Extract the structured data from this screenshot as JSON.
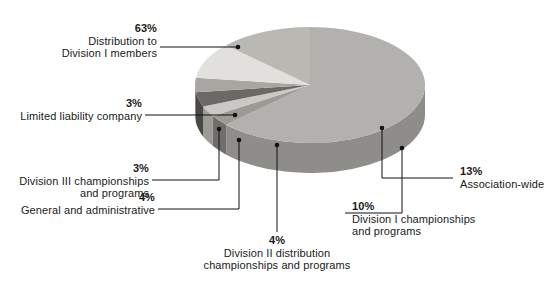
{
  "chart_data": {
    "type": "pie",
    "title": "",
    "subtitle": "",
    "xlabel": "",
    "ylabel": "",
    "legend_position": "callout-labels",
    "grid": false,
    "style": "3d-pie",
    "categories": [
      "Distribution to Division I members",
      "Limited liability company",
      "Division III championships and programs",
      "General and administrative",
      "Division II distribution championships and programs",
      "Division I championships and programs",
      "Association-wide"
    ],
    "values": [
      63,
      3,
      3,
      4,
      4,
      10,
      13
    ],
    "unit": "%",
    "slices": [
      {
        "label": "Distribution to Division I members",
        "value": 63,
        "value_text": "63%",
        "color": "#b2b1ad",
        "side_color": "#8e8d89"
      },
      {
        "label": "Limited liability company",
        "value": 3,
        "value_text": "3%",
        "color": "#9b9a95",
        "side_color": "#6f6e6a"
      },
      {
        "label": "Division III championships and programs",
        "value": 3,
        "value_text": "3%",
        "color": "#c9c8c4",
        "side_color": "#9c9b96"
      },
      {
        "label": "General and administrative",
        "value": 4,
        "value_text": "4%",
        "color": "#6b6965",
        "side_color": "#4a4845"
      },
      {
        "label": "Division II distribution championships and programs",
        "value": 4,
        "value_text": "4%",
        "color": "#a7a6a1",
        "side_color": "#7d7c77"
      },
      {
        "label": "Division I championships and programs",
        "value": 10,
        "value_text": "10%",
        "color": "#e1e0dc",
        "side_color": "#b4b3af"
      },
      {
        "label": "Association-wide",
        "value": 13,
        "value_text": "13%",
        "color": "#b9b8b3",
        "side_color": "#929189"
      }
    ]
  },
  "labels": [
    {
      "name": "distribution-division-i-members",
      "percent": "63%",
      "lines": [
        "Distribution to",
        "Division I members"
      ]
    },
    {
      "name": "limited-liability-company",
      "percent": "3%",
      "lines": [
        "Limited liability company"
      ]
    },
    {
      "name": "division-iii-championships",
      "percent": "3%",
      "lines": [
        "Division III championships",
        "and programs"
      ]
    },
    {
      "name": "general-and-administrative",
      "percent": "4%",
      "lines": [
        "General and administrative"
      ]
    },
    {
      "name": "division-ii-distribution",
      "percent": "4%",
      "lines": [
        "Division II distribution",
        "championships and programs"
      ]
    },
    {
      "name": "division-i-championships",
      "percent": "10%",
      "lines": [
        "Division I championships",
        "and programs"
      ]
    },
    {
      "name": "association-wide",
      "percent": "13%",
      "lines": [
        "Association-wide"
      ]
    }
  ],
  "colors": {
    "background": "#ffffff",
    "text": "#1a1a1a",
    "leader_line": "#111111",
    "slice_lightest": "#e1e0dc",
    "slice_darkest": "#6b6965"
  }
}
